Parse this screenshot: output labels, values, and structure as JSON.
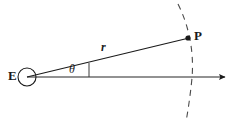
{
  "figure": {
    "kind": "geometry-diagram",
    "background_color": "#ffffff",
    "labels": {
      "origin": "E",
      "point": "P",
      "radius": "r",
      "angle": "θ"
    },
    "colors": {
      "stroke_dark": "#1a1a1a",
      "stroke_gray": "#6e6e6e",
      "dashed_arc": "#4a4a4a",
      "text": "#1a1a1a"
    },
    "geometry": {
      "origin_circle": {
        "cx": 27,
        "cy": 77,
        "r": 9
      },
      "point_marker": {
        "cx": 188,
        "cy": 38,
        "r": 2.6
      },
      "radius_ray": {
        "x1": 27,
        "y1": 77,
        "x2": 188,
        "y2": 38
      },
      "axis_ray": {
        "x1": 27,
        "y1": 77,
        "x2": 231,
        "y2": 77
      },
      "angle_tick": {
        "x": 89,
        "y1": 63,
        "y2": 77
      },
      "dashed_arc_path": "M 178 4 C 190 28, 194 54, 192 78 C 190 98, 188 110, 186 122"
    }
  }
}
